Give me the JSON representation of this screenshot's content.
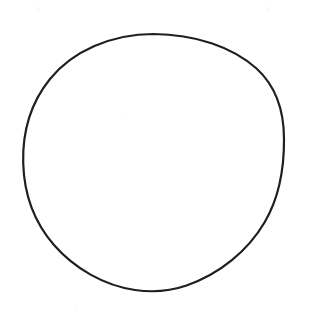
{
  "document": {
    "kind": "scanned-line-drawing",
    "page_background_color": "#ffffff",
    "width": 309,
    "height": 316,
    "text_content": "",
    "caption": "",
    "label": ""
  },
  "figure": {
    "name": "circle",
    "shape_type": "circle",
    "stroke_color": "#1f1f1f",
    "fill_color": "none",
    "stroke_width": 2.2,
    "center_x": 153.5,
    "center_y": 162.5,
    "radius_x": 130.5,
    "radius_y": 128.5,
    "bounds": {
      "left": 23,
      "top": 34,
      "right": 284,
      "bottom": 291
    },
    "path": "M 153.5 34 C 195.0 34.2 232.5 47.0 256.5 68.5 C 275.5 85.8 284.0 110.5 284.0 139.0 C 284.2 168.5 279.0 198.0 264.5 222.5 C 248.0 250.5 220.0 274.0 186.5 285.5 C 170.0 291.2 152.0 292.5 135.0 290.0 C 104.0 285.5 74.5 268.5 54.0 245.0 C 34.0 222.0 24.0 193.0 23.2 163.0 C 22.4 132.5 31.0 102.5 50.0 79.0 C 72.5 51.2 111.5 34.0 153.5 34 Z"
  },
  "specks": [
    {
      "x": 74,
      "y": 306,
      "size": 3,
      "color": "#f7f7f7"
    },
    {
      "x": 95,
      "y": 113,
      "size": 2,
      "color": "#fafafa"
    },
    {
      "x": 125,
      "y": 118,
      "size": 2,
      "color": "#fafafa"
    },
    {
      "x": 36,
      "y": 6,
      "size": 5,
      "color": "#fcfcfc"
    },
    {
      "x": 265,
      "y": 7,
      "size": 5,
      "color": "#fcfcfc"
    },
    {
      "x": 143,
      "y": 14,
      "size": 2,
      "color": "#fbfbfb"
    }
  ]
}
